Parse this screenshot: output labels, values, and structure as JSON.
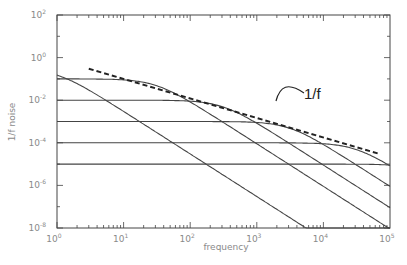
{
  "chart_data": {
    "type": "line",
    "title": "",
    "xlabel": "frequency",
    "ylabel": "1/f noise",
    "xscale": "log",
    "yscale": "log",
    "xlim": [
      1,
      100000
    ],
    "ylim": [
      1e-08,
      100
    ],
    "grid": false,
    "legend": null,
    "x_ticks": [
      {
        "value": 1,
        "base": "10",
        "exp": "0"
      },
      {
        "value": 10,
        "base": "10",
        "exp": "1"
      },
      {
        "value": 100,
        "base": "10",
        "exp": "2"
      },
      {
        "value": 1000,
        "base": "10",
        "exp": "3"
      },
      {
        "value": 10000,
        "base": "10",
        "exp": "4"
      },
      {
        "value": 100000,
        "base": "10",
        "exp": "5"
      }
    ],
    "y_ticks": [
      {
        "value": 100,
        "base": "10",
        "exp": "2"
      },
      {
        "value": 1,
        "base": "10",
        "exp": "0"
      },
      {
        "value": 0.01,
        "base": "10",
        "exp": "-2"
      },
      {
        "value": 0.0001,
        "base": "10",
        "exp": "-4"
      },
      {
        "value": 1e-06,
        "base": "10",
        "exp": "-6"
      },
      {
        "value": 1e-08,
        "base": "10",
        "exp": "-8"
      }
    ],
    "series": [
      {
        "name": "lorentzian-1",
        "plateau": 0.3,
        "corner_freq": 1,
        "style": "solid"
      },
      {
        "name": "lorentzian-2",
        "plateau": 0.1,
        "corner_freq": 30,
        "style": "solid"
      },
      {
        "name": "lorentzian-3",
        "plateau": 0.01,
        "corner_freq": 300,
        "style": "solid"
      },
      {
        "name": "lorentzian-4",
        "plateau": 0.001,
        "corner_freq": 3000,
        "style": "solid"
      },
      {
        "name": "lorentzian-5",
        "plateau": 0.0001,
        "corner_freq": 30000,
        "style": "solid"
      },
      {
        "name": "lorentzian-6",
        "plateau": 1e-05,
        "corner_freq": 300000,
        "style": "solid"
      },
      {
        "name": "1/f envelope",
        "x": [
          3,
          70000
        ],
        "y": [
          0.3,
          3e-05
        ],
        "style": "dashed"
      }
    ],
    "annotations": [
      {
        "text": "1/f",
        "x": 4000,
        "y": 0.003,
        "arrow_to": "dashed envelope"
      }
    ]
  }
}
